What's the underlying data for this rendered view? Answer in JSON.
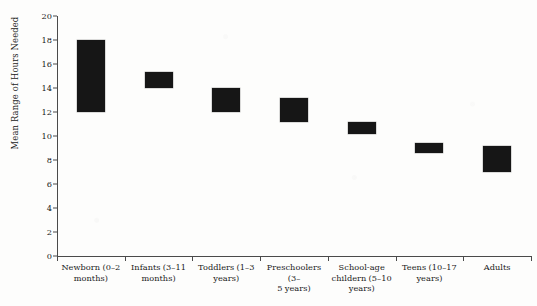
{
  "chart_data": {
    "type": "bar",
    "bar_style": "floating-range",
    "title": "",
    "subtitle": "",
    "xlabel": "",
    "ylabel": "Mean Range of  Hours Needed",
    "ylim": [
      0,
      20
    ],
    "yticks": [
      0,
      2,
      4,
      6,
      8,
      10,
      12,
      14,
      16,
      18,
      20
    ],
    "ytick_labels": [
      "0",
      "2",
      "4",
      "6",
      "8",
      "10",
      "12",
      "14",
      "16",
      "18",
      "20"
    ],
    "grid": false,
    "legend": null,
    "bar_color": "#161616",
    "axis_color": "#4a4a4a",
    "background_color": "#fdfdfc",
    "categories": [
      "Newborn (0–2 months)",
      "Infants (3–11 months)",
      "Toddlers (1–3 years)",
      "Preschoolers (3–5 years)",
      "School-age childern (5–10 years)",
      "Teens (10–17 years)",
      "Adults"
    ],
    "category_lines": [
      [
        "Newborn (0–2",
        "months)"
      ],
      [
        "Infants (3–11",
        "months)"
      ],
      [
        "Toddlers (1–3",
        "years)"
      ],
      [
        "Preschoolers (3–",
        "5 years)"
      ],
      [
        "School-age",
        "childern (5–10",
        "years)"
      ],
      [
        "Teens (10–17",
        "years)"
      ],
      [
        "Adults"
      ]
    ],
    "series": [
      {
        "name": "Mean Range of Hours Needed",
        "low": [
          12.0,
          14.0,
          12.0,
          11.2,
          10.2,
          8.6,
          7.0
        ],
        "high": [
          18.0,
          15.3,
          14.0,
          13.2,
          11.2,
          9.4,
          9.2
        ]
      }
    ],
    "annotations": []
  }
}
